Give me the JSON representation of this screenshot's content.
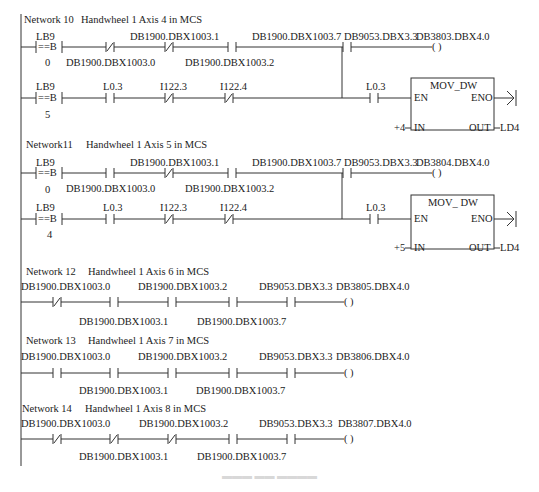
{
  "networks": [
    {
      "id": "network-10",
      "title": "Network 10",
      "comment": "Handwheel 1 Axis 4 in MCS",
      "row1": {
        "compare": {
          "operand": "LB9",
          "op": "==B",
          "value": "0"
        },
        "contacts": [
          {
            "addr": "DB1900.DBX1003.0",
            "type": "NC"
          },
          {
            "addr": "DB1900.DBX1003.1",
            "type": "NC"
          },
          {
            "addr": "DB1900.DBX1003.2",
            "type": "NO"
          },
          {
            "addr": "DB1900.DBX1003.7",
            "type": "NO"
          },
          {
            "addr": "DB9053.DBX3.3",
            "type": "NO"
          }
        ],
        "coil": {
          "addr": "DB3803.DBX4.0",
          "symbol": "(   )"
        }
      },
      "row2": {
        "compare": {
          "operand": "LB9",
          "op": "==B",
          "value": "5"
        },
        "contacts": [
          {
            "addr": "L0.3",
            "type": "NO"
          },
          {
            "addr": "I122.3",
            "type": "NC"
          },
          {
            "addr": "I122.4",
            "type": "NC"
          },
          {
            "addr": "L0.3",
            "type": "NO"
          }
        ],
        "box": {
          "name": "MOV_DW",
          "en": "EN",
          "eno": "ENO",
          "in_pin": "IN",
          "out_pin": "OUT",
          "in_value": "+4",
          "out_value": "LD4"
        }
      }
    },
    {
      "id": "network-11",
      "title": "Network11",
      "comment": "Handwheel 1 Axis 5 in MCS",
      "row1": {
        "compare": {
          "operand": "LB9",
          "op": "==B",
          "value": "0"
        },
        "contacts": [
          {
            "addr": "DB1900.DBX1003.0",
            "type": "NO"
          },
          {
            "addr": "DB1900.DBX1003.1",
            "type": "NC"
          },
          {
            "addr": "DB1900.DBX1003.2",
            "type": "NO"
          },
          {
            "addr": "DB1900.DBX1003.7",
            "type": "NO"
          },
          {
            "addr": "DB9053.DBX3.3",
            "type": "NO"
          }
        ],
        "coil": {
          "addr": "DB3804.DBX4.0",
          "symbol": "(   )"
        }
      },
      "row2": {
        "compare": {
          "operand": "LB9",
          "op": "==B",
          "value": "4"
        },
        "contacts": [
          {
            "addr": "L0.3",
            "type": "NO"
          },
          {
            "addr": "I122.3",
            "type": "NC"
          },
          {
            "addr": "I122.4",
            "type": "NC"
          },
          {
            "addr": "L0.3",
            "type": "NO"
          }
        ],
        "box": {
          "name": "MOV_ DW",
          "en": "EN",
          "eno": "ENO",
          "in_pin": "IN",
          "out_pin": "OUT",
          "in_value": "+5",
          "out_value": "LD4"
        }
      }
    },
    {
      "id": "network-12",
      "title": "Network 12",
      "comment": "Handwheel 1 Axis 6 in MCS",
      "contacts": [
        {
          "addr": "DB1900.DBX1003.0",
          "type": "NC"
        },
        {
          "addr": "DB1900.DBX1003.1",
          "type": "NO"
        },
        {
          "addr": "DB1900.DBX1003.2",
          "type": "NO"
        },
        {
          "addr": "DB1900.DBX1003.7",
          "type": "NO"
        },
        {
          "addr": "DB9053.DBX3.3",
          "type": "NO"
        }
      ],
      "coil": {
        "addr": "DB3805.DBX4.0",
        "symbol": "(   )"
      }
    },
    {
      "id": "network-13",
      "title": "Network 13",
      "comment": "Handwheel 1 Axis 7 in MCS",
      "contacts": [
        {
          "addr": "DB1900.DBX1003.0",
          "type": "NO"
        },
        {
          "addr": "DB1900.DBX1003.1",
          "type": "NO"
        },
        {
          "addr": "DB1900.DBX1003.2",
          "type": "NO"
        },
        {
          "addr": "DB1900.DBX1003.7",
          "type": "NO"
        },
        {
          "addr": "DB9053.DBX3.3",
          "type": "NO"
        }
      ],
      "coil": {
        "addr": "DB3806.DBX4.0",
        "symbol": "(   )"
      }
    },
    {
      "id": "network-14",
      "title": "Network 14",
      "comment": "Handwheel 1 Axis 8 in MCS",
      "contacts": [
        {
          "addr": "DB1900.DBX1003.0",
          "type": "NC"
        },
        {
          "addr": "DB1900.DBX1003.1",
          "type": "NC"
        },
        {
          "addr": "DB1900.DBX1003.2",
          "type": "NC"
        },
        {
          "addr": "DB1900.DBX1003.7",
          "type": "NO"
        },
        {
          "addr": "DB9053.DBX3.3",
          "type": "NO"
        }
      ],
      "coil": {
        "addr": "DB3807.DBX4.0",
        "symbol": "(   )"
      }
    }
  ],
  "symbols": {
    "no_contact": "┤ ├",
    "nc_contact": "┤/├"
  }
}
